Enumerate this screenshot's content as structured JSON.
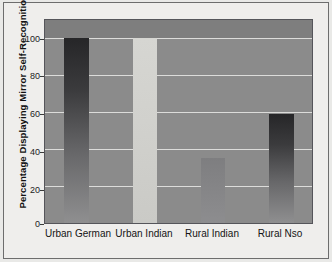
{
  "chart_data": {
    "type": "bar",
    "title": "",
    "subtitle": "",
    "xlabel": "",
    "ylabel": "Percentage Displaying Mirror Self-Recognition",
    "categories": [
      "Urban German",
      "Urban Indian",
      "Rural Indian",
      "Rural Nso"
    ],
    "values": [
      100,
      100,
      35,
      59
    ],
    "ylim": [
      0,
      110
    ],
    "yticks": [
      0,
      20,
      40,
      60,
      80,
      100
    ],
    "ytick_labels": [
      "0",
      "20",
      "40",
      "60",
      "80",
      "100"
    ],
    "grid": true,
    "legend": "none",
    "bar_styles": [
      "dark-gradient",
      "light",
      "mid-gray",
      "dark-gradient"
    ],
    "colors": {
      "plot_background": "#8b8b8b",
      "figure_background": "#efeeec",
      "gridline": "#e4e4e2",
      "bar_dark": "#2a2a2c",
      "bar_light": "#d4d4d0",
      "bar_mid": "#848486",
      "axis": "#55555a",
      "text": "#141414"
    }
  }
}
